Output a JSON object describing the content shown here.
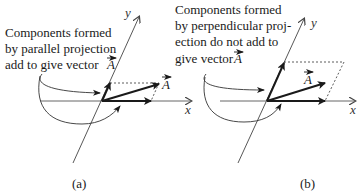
{
  "panels": [
    {
      "id": "a",
      "label": "(a)",
      "caption_lines": [
        "Components formed",
        "by parallel projection",
        "add to give vector"
      ],
      "caption_vector": "A",
      "x_axis_label": "x",
      "y_axis_label": "y",
      "vector_label": "A",
      "projection": "parallel"
    },
    {
      "id": "b",
      "label": "(b)",
      "caption_lines": [
        "Components formed",
        "by perpendicular proj-",
        "ection do not add to",
        "give vector"
      ],
      "caption_vector": "A",
      "x_axis_label": "x",
      "y_axis_label": "y",
      "vector_label": "A",
      "projection": "perpendicular"
    }
  ],
  "colors": {
    "axis": "#555555",
    "vector": "#1a1a1a",
    "dashed": "#333333"
  }
}
